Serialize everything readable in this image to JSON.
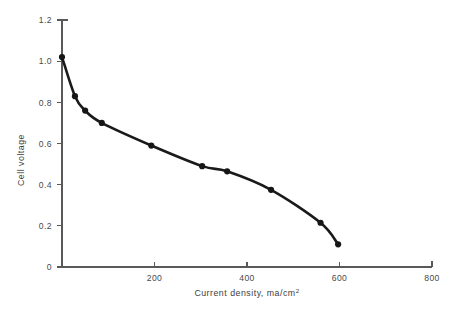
{
  "chart_data": {
    "type": "line",
    "title": "",
    "xlabel": "Current density, ma/cm",
    "xlabel_superscript": "2",
    "ylabel": "Cell voltage",
    "xlim": [
      0,
      800
    ],
    "ylim": [
      0,
      1.2
    ],
    "grid": false,
    "legend": null,
    "x_ticks": [
      0,
      200,
      400,
      600,
      800
    ],
    "x_tick_labels": [
      "0",
      "200",
      "400",
      "600",
      "800"
    ],
    "y_ticks": [
      0,
      0.2,
      0.4,
      0.6,
      0.8,
      1.0,
      1.2
    ],
    "y_tick_labels": [
      "0",
      "0.2",
      "0.4",
      "0.6",
      "0.8",
      "1.0",
      "1.2"
    ],
    "series": [
      {
        "name": "Cell polarization curve",
        "marker": "filled-circle",
        "color": "#161616",
        "x": [
          0,
          28,
          50,
          86,
          193,
          303,
          357,
          452,
          559,
          597
        ],
        "y": [
          1.02,
          0.83,
          0.76,
          0.7,
          0.59,
          0.49,
          0.465,
          0.375,
          0.215,
          0.11
        ]
      }
    ]
  },
  "figure": {
    "background_color": "#ffffff",
    "axis_color": "#595959",
    "curve_color": "#161616"
  }
}
